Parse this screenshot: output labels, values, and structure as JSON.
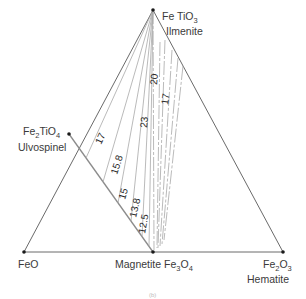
{
  "diagram": {
    "type": "ternary-phase-diagram",
    "vertices": {
      "top": {
        "formula": "Fe TiO",
        "sub": "3",
        "name": "Ilmenite"
      },
      "left": {
        "formula": "FeO"
      },
      "right": {
        "formula": "Fe",
        "sub1": "2",
        "mid": "O",
        "sub2": "3",
        "name": "Hematite"
      }
    },
    "edge_points": {
      "ulvospinel": {
        "formula": "Fe",
        "sub1": "2",
        "mid": "TiO",
        "sub2": "4",
        "name": "Ulvospinel"
      },
      "magnetite": {
        "name": "Magnetite",
        "formula": "Fe",
        "sub1": "3",
        "mid": "O",
        "sub2": "4"
      }
    },
    "isolines_solid": [
      "17",
      "15.8",
      "15",
      "13.8",
      "12.5"
    ],
    "isolines_dashed": [
      "23",
      "20",
      "17"
    ],
    "caption": "(b)"
  },
  "colors": {
    "triangle": "#6a6a6a",
    "tie_line": "#8c8c8c",
    "isoline": "#a8a8a8",
    "vertex_dot": "#1a1a1a",
    "text": "#3a3a3a"
  }
}
